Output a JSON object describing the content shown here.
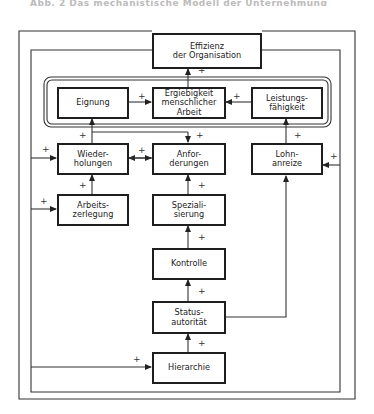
{
  "header": {
    "title": "Abb. 2 Das mechanistische Modell der Unternehmung"
  },
  "diagram": {
    "type": "flowchart",
    "nodes": {
      "effizienz": "Effizienz\nder Organisation",
      "eignung": "Eignung",
      "ergiebigkeit": "Ergiebigkeit\nmenschlicher\nArbeit",
      "leistungsfaehigkeit": "Leistungs-\nfähigkeit",
      "wiederholungen": "Wieder-\nholungen",
      "anforderungen": "Anfor-\nderungen",
      "lohnanreize": "Lohn-\nanreize",
      "arbeitszerlegung": "Arbeits-\nzerlegung",
      "spezialisierung": "Speziali-\nsierung",
      "kontrolle": "Kontrolle",
      "statusautoritaet": "Status-\nautorität",
      "hierarchie": "Hierarchie"
    },
    "sign": "+",
    "edges": [
      {
        "from": "ergiebigkeit",
        "to": "effizienz",
        "sign": "+"
      },
      {
        "from": "eignung",
        "to": "ergiebigkeit",
        "sign": "+"
      },
      {
        "from": "leistungsfaehigkeit",
        "to": "ergiebigkeit",
        "sign": "+"
      },
      {
        "from": "wiederholungen",
        "to": "eignung",
        "sign": "+"
      },
      {
        "from": "effizienz",
        "to": "anforderungen",
        "sign": "+"
      },
      {
        "from": "lohnanreize",
        "to": "leistungsfaehigkeit",
        "sign": "+"
      },
      {
        "from": "anforderungen",
        "to": "wiederholungen",
        "sign": "+"
      },
      {
        "from": "effizienz",
        "to": "wiederholungen",
        "sign": "+"
      },
      {
        "from": "effizienz",
        "to": "lohnanreize",
        "sign": "+"
      },
      {
        "from": "arbeitszerlegung",
        "to": "wiederholungen",
        "sign": "+"
      },
      {
        "from": "effizienz",
        "to": "arbeitszerlegung",
        "sign": "+"
      },
      {
        "from": "spezialisierung",
        "to": "anforderungen",
        "sign": "+"
      },
      {
        "from": "kontrolle",
        "to": "spezialisierung",
        "sign": "+"
      },
      {
        "from": "statusautoritaet",
        "to": "kontrolle",
        "sign": "+"
      },
      {
        "from": "statusautoritaet",
        "to": "lohnanreize",
        "sign": ""
      },
      {
        "from": "hierarchie",
        "to": "statusautoritaet",
        "sign": "+"
      },
      {
        "from": "effizienz",
        "to": "hierarchie",
        "sign": "+"
      }
    ]
  }
}
